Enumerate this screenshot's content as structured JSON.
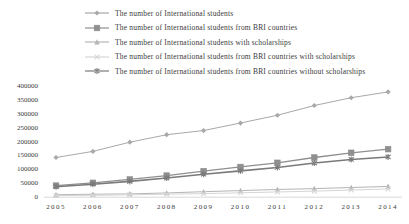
{
  "chart_data": {
    "type": "line",
    "x": [
      2005,
      2006,
      2007,
      2008,
      2009,
      2010,
      2011,
      2012,
      2013,
      2014
    ],
    "series": [
      {
        "name": "The number of International students",
        "marker": "diamond",
        "color": "#a8a8a8",
        "values": [
          141000,
          163000,
          196000,
          223000,
          238000,
          265000,
          293000,
          328000,
          356000,
          377000
        ]
      },
      {
        "name": "The number of International students from BRI countries",
        "marker": "square",
        "color": "#8f8f8f",
        "values": [
          40000,
          50000,
          62000,
          76000,
          92000,
          107000,
          122000,
          141000,
          158000,
          171000
        ]
      },
      {
        "name": "The number of International students with scholarships",
        "marker": "triangle",
        "color": "#b5b5b5",
        "values": [
          7000,
          9000,
          10000,
          13500,
          18000,
          22000,
          26000,
          29000,
          33000,
          37000
        ]
      },
      {
        "name": "The number of International students from BRI countries with scholarships",
        "marker": "x",
        "color": "#d6d6d6",
        "values": [
          4000,
          5000,
          7000,
          9000,
          11000,
          14000,
          17000,
          20000,
          24000,
          28000
        ]
      },
      {
        "name": "The number of International students from BRI countries without scholarships",
        "marker": "asterisk",
        "color": "#7a7a7a",
        "values": [
          36000,
          45000,
          55000,
          67000,
          81000,
          93000,
          105000,
          121000,
          134000,
          143000
        ]
      }
    ],
    "ylim": [
      0,
      400000
    ],
    "ytick_step": 50000,
    "yticks": [
      "0",
      "50000",
      "100000",
      "150000",
      "200000",
      "250000",
      "300000",
      "350000",
      "400000"
    ],
    "grid": false,
    "legend_position": "top",
    "axis_color": "#d8d8d8",
    "tick_label_color": "#3a3a3a"
  }
}
